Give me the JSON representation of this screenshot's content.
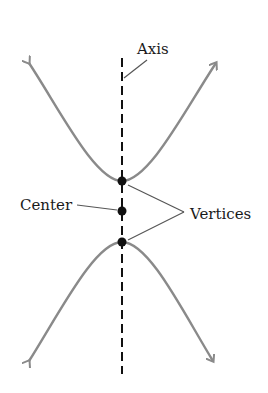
{
  "diagram": {
    "type": "hyperbola",
    "labels": {
      "axis": "Axis",
      "center": "Center",
      "vertices": "Vertices"
    },
    "points": {
      "upper_vertex": [
        122,
        181
      ],
      "center": [
        122,
        211
      ],
      "lower_vertex": [
        122,
        242
      ]
    },
    "colors": {
      "curve": "#8a8a8a",
      "axis": "#111111",
      "points": "#111111",
      "leader": "#555555",
      "text": "#1a1a1a"
    }
  }
}
